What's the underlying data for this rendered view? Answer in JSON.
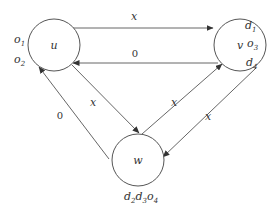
{
  "diagram": {
    "type": "directed-graph",
    "nodes": [
      {
        "id": "u",
        "label": "u",
        "annotations": [
          "o1",
          "o2"
        ]
      },
      {
        "id": "v",
        "label": "v",
        "annotations": [
          "d1",
          "o3",
          "d4"
        ]
      },
      {
        "id": "w",
        "label": "w",
        "annotations": [
          "d2d3o4"
        ]
      }
    ],
    "edges": [
      {
        "from": "u",
        "to": "v",
        "label": "x"
      },
      {
        "from": "v",
        "to": "u",
        "label": "0"
      },
      {
        "from": "u",
        "to": "w",
        "label": "x"
      },
      {
        "from": "w",
        "to": "u",
        "label": "0"
      },
      {
        "from": "w",
        "to": "v",
        "label": "x"
      },
      {
        "from": "v",
        "to": "w",
        "label": "x"
      }
    ]
  },
  "labels": {
    "node_u": "u",
    "node_v": "v",
    "node_w": "w",
    "edge_uv": "x",
    "edge_vu": "0",
    "edge_uw": "x",
    "edge_wu": "0",
    "edge_wv": "x",
    "edge_vw": "x",
    "u_ann1": {
      "base": "o",
      "sub": "1"
    },
    "u_ann2": {
      "base": "o",
      "sub": "2"
    },
    "v_ann1": {
      "base": "d",
      "sub": "1"
    },
    "v_ann2": {
      "base": "o",
      "sub": "3"
    },
    "v_ann3": {
      "base": "d",
      "sub": "4"
    },
    "w_ann": [
      {
        "base": "d",
        "sub": "2"
      },
      {
        "base": "d",
        "sub": "3"
      },
      {
        "base": "o",
        "sub": "4"
      }
    ]
  }
}
